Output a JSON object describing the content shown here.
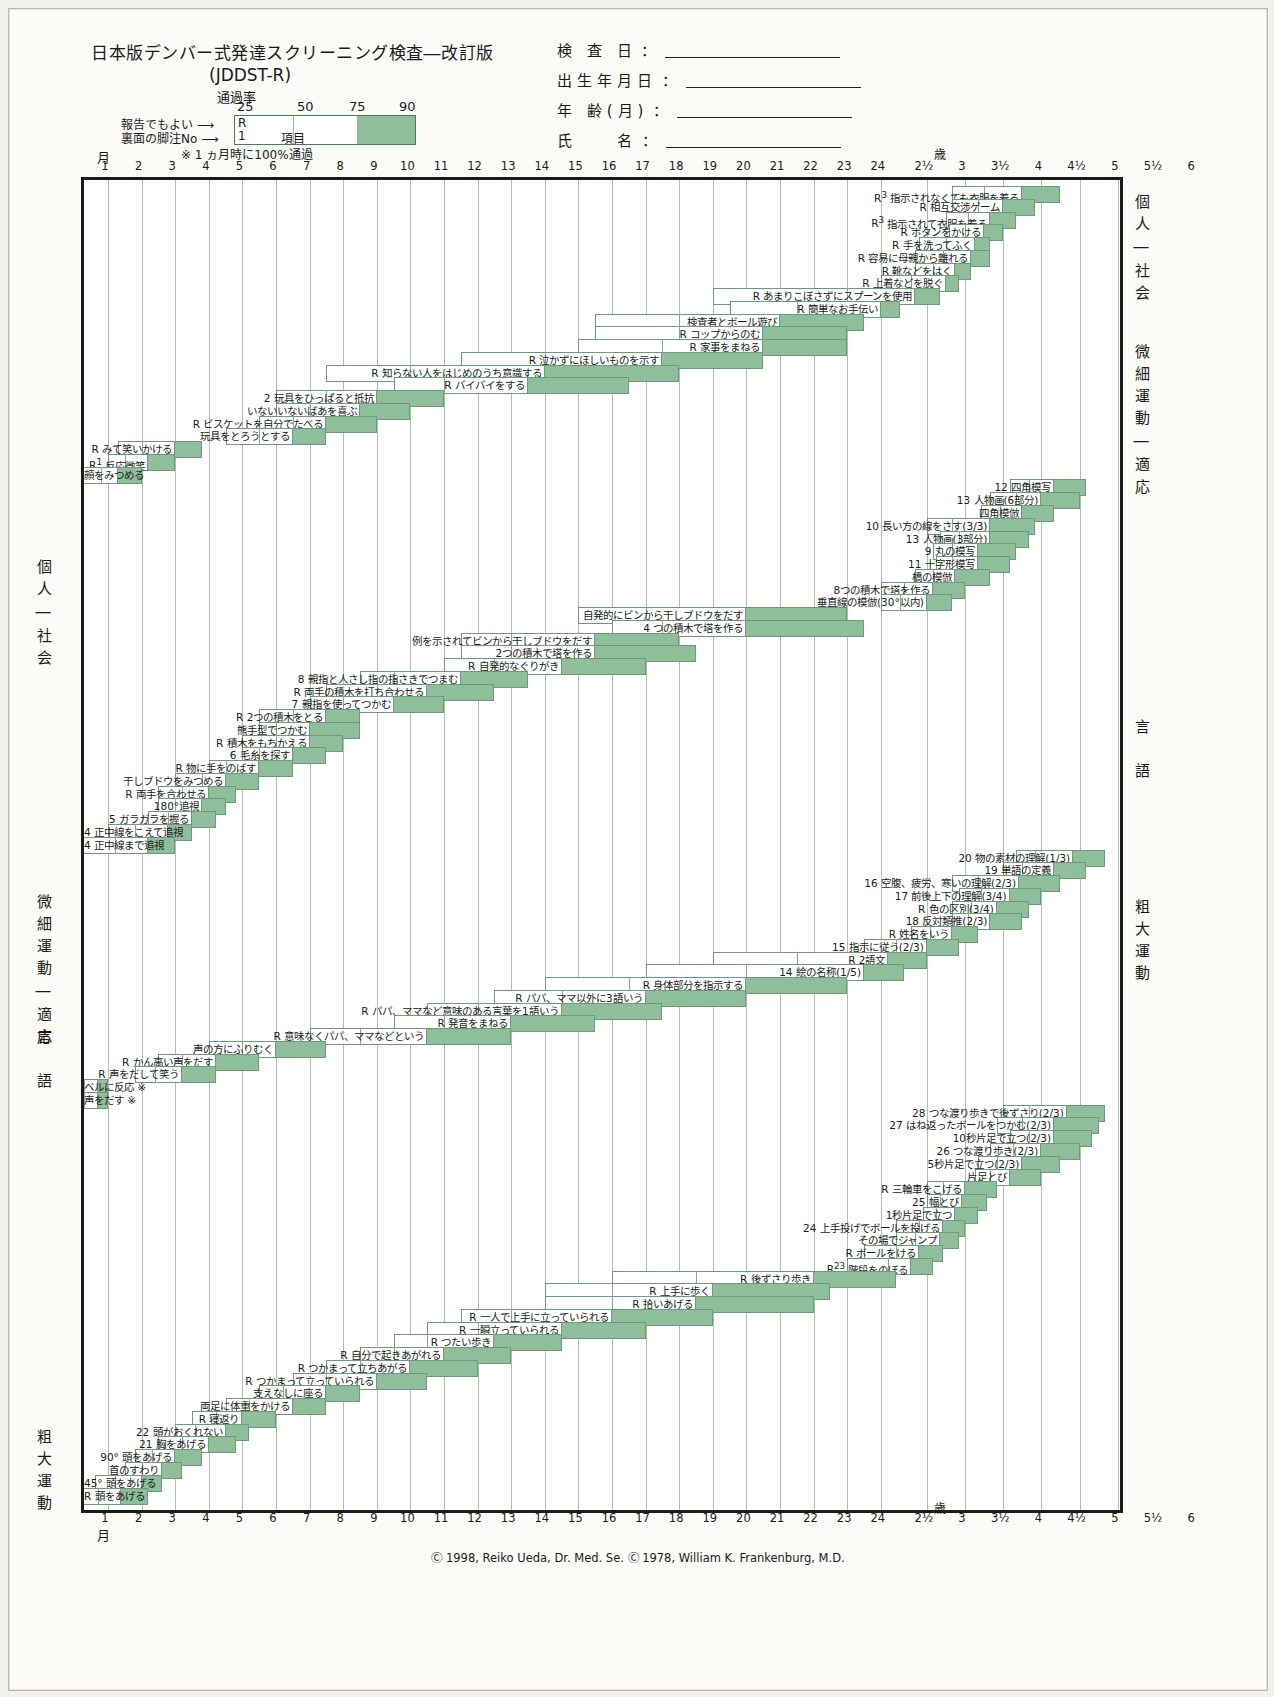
{
  "header": {
    "title": "日本版デンバー式発達スクリーニング検査―改訂版",
    "subtitle": "(JDDST-R)",
    "rate_label": "通過率",
    "pct_ticks": [
      "25",
      "50",
      "75",
      "90"
    ],
    "legend_r": "R",
    "legend_no": "1",
    "legend_item": "項目",
    "arrow_report": "報告でもよい ⟶",
    "arrow_footnote": "裏面の脚注No ⟶",
    "note": "※ 1 ヵ月時に100%通過",
    "month_label": "月",
    "fields": [
      {
        "label": "検 査 日",
        "value": ""
      },
      {
        "label": "出生年月日",
        "value": ""
      },
      {
        "label": "年 齢(月)",
        "value": ""
      },
      {
        "label": "氏　　名",
        "value": ""
      }
    ]
  },
  "axis": {
    "unit_month": "月",
    "unit_year": "歳",
    "ticks": [
      "1",
      "2",
      "3",
      "4",
      "5",
      "6",
      "7",
      "8",
      "9",
      "10",
      "11",
      "12",
      "13",
      "14",
      "15",
      "16",
      "17",
      "18",
      "19",
      "20",
      "21",
      "22",
      "23",
      "24",
      "2½",
      "3",
      "3½",
      "4",
      "4½",
      "5",
      "5½",
      "6"
    ]
  },
  "side_labels": {
    "right_top": "個人―社会",
    "right_fine": "微細運動―適応",
    "right_lang": "言　語",
    "right_gross": "粗大運動",
    "left_personal": "個人―社会",
    "left_fine": "微細運動―適応",
    "left_lang": "言　語",
    "left_gross": "粗大運動"
  },
  "footer": {
    "copyright": "Ⓒ 1998, Reiko Ueda, Dr. Med. Se. Ⓒ 1978, William K. Frankenburg, M.D."
  },
  "colors": {
    "green": "#8fbf9a",
    "green_border": "#6f9a79",
    "grid": "#a8c3ad",
    "frame": "#1c1c1a"
  },
  "chart_data": {
    "type": "bar",
    "title": "日本版デンバー式発達スクリーニング検査―改訂版 (JDDST-R)",
    "xlabel": "月 / 歳",
    "ylabel": "",
    "legend": [
      "25% 通過",
      "50% 通過",
      "75% 通過",
      "90% 通過"
    ],
    "note": "各バーは左端=25%通過月齢、内側の縦線=50%、白/緑境界=75%、右端=90%通過月齢",
    "items": [
      {
        "row": 0,
        "prefix": "R<sup>3</sup>",
        "label": "指示されなくても衣服を着る",
        "p25": 34.0,
        "p75": 45.0,
        "p90": 51.0,
        "p50": 39.0
      },
      {
        "row": 1,
        "prefix": "R",
        "label": "相互交渉ゲーム",
        "p25": 34.0,
        "p75": 42.0,
        "p90": 47.0,
        "p50": 38.0
      },
      {
        "row": 2,
        "prefix": "R<sup>3</sup>",
        "label": "指示されて衣服を着る",
        "p25": 33.0,
        "p75": 40.0,
        "p90": 44.0,
        "p50": 36.5
      },
      {
        "row": 3,
        "prefix": "R",
        "label": "ボタンをかける",
        "p25": 33.5,
        "p75": 39.0,
        "p90": 42.0,
        "p50": 36.0
      },
      {
        "row": 4,
        "prefix": "R",
        "label": "手を洗ってふく",
        "p25": 29.0,
        "p75": 37.5,
        "p90": 40.0,
        "p50": 33.0
      },
      {
        "row": 5,
        "prefix": "R",
        "label": "容易に母親から離れる",
        "p25": 28.5,
        "p75": 37.0,
        "p90": 40.0,
        "p50": 32.5
      },
      {
        "row": 6,
        "prefix": "R",
        "label": "靴などをはく",
        "p25": 28.5,
        "p75": 34.5,
        "p90": 37.0,
        "p50": 31.0
      },
      {
        "row": 7,
        "prefix": "R",
        "label": "上着などを脱ぐ",
        "p25": 24.0,
        "p75": 33.0,
        "p90": 35.0,
        "p50": 28.0
      },
      {
        "row": 8,
        "prefix": "R",
        "label": "あまりこぼさずにスプーンを使用",
        "p25": 19.0,
        "p75": 28.5,
        "p90": 32.0,
        "p50": 23.0
      },
      {
        "row": 9,
        "prefix": "R",
        "label": "簡単なお手伝い",
        "p25": 19.5,
        "p75": 24.0,
        "p90": 26.5,
        "p50": 21.5
      },
      {
        "row": 10,
        "prefix": "",
        "label": "検査者とボール遊び",
        "p25": 15.5,
        "p75": 21.0,
        "p90": 23.5,
        "p50": 18.0
      },
      {
        "row": 11,
        "prefix": "R",
        "label": "コップからのむ",
        "p25": 15.5,
        "p75": 20.5,
        "p90": 23.0,
        "p50": 18.0
      },
      {
        "row": 12,
        "prefix": "R",
        "label": "家事をまねる",
        "p25": 15.0,
        "p75": 20.5,
        "p90": 23.0,
        "p50": 17.5
      },
      {
        "row": 13,
        "prefix": "R",
        "label": "泣かずにほしいものを示す",
        "p25": 11.5,
        "p75": 17.5,
        "p90": 20.5,
        "p50": 14.0
      },
      {
        "row": 14,
        "prefix": "R",
        "label": "知らない人をはじめのうち意識する",
        "p25": 7.5,
        "p75": 14.0,
        "p90": 18.0,
        "p50": 10.0
      },
      {
        "row": 15,
        "prefix": "R",
        "label": "バイバイをする",
        "p25": 9.5,
        "p75": 13.5,
        "p90": 16.5,
        "p50": 11.0
      },
      {
        "row": 16,
        "prefix": "2",
        "label": "玩具をひっぱると抵抗",
        "p25": 6.0,
        "p75": 9.0,
        "p90": 11.0,
        "p50": 7.5
      },
      {
        "row": 17,
        "prefix": "",
        "label": "いないいないばあを喜ぶ",
        "p25": 6.0,
        "p75": 8.5,
        "p90": 10.0,
        "p50": 7.0
      },
      {
        "row": 18,
        "prefix": "R",
        "label": "ビスケットを自分でたべる",
        "p25": 5.5,
        "p75": 7.5,
        "p90": 9.0,
        "p50": 6.5
      },
      {
        "row": 19,
        "prefix": "",
        "label": "玩具をとろうとする",
        "p25": 4.5,
        "p75": 6.5,
        "p90": 7.5,
        "p50": 5.5
      },
      {
        "row": 20,
        "prefix": "R",
        "label": "みて笑いかける",
        "p25": 1.3,
        "p75": 3.0,
        "p90": 3.8,
        "p50": 2.0
      },
      {
        "row": 21,
        "prefix": "R<sup>1</sup>",
        "label": "反応微笑",
        "p25": 1.0,
        "p75": 2.2,
        "p90": 3.0,
        "p50": 1.5
      },
      {
        "row": 22,
        "prefix": "",
        "label": "顔をみつめる",
        "p25": 0.0,
        "p75": 1.3,
        "p90": 2.0,
        "p50": 0.8
      },
      {
        "row": 23,
        "prefix": "12",
        "label": "四角模写",
        "p25": 43.0,
        "p75": 50.0,
        "p90": 55.0,
        "p50": 46.0
      },
      {
        "row": 24,
        "prefix": "13",
        "label": "人物画(6部分)",
        "p25": 40.0,
        "p75": 48.0,
        "p90": 54.0,
        "p50": 44.0
      },
      {
        "row": 25,
        "prefix": "",
        "label": "四角模倣",
        "p25": 38.5,
        "p75": 45.0,
        "p90": 50.0,
        "p50": 41.5
      },
      {
        "row": 26,
        "prefix": "10",
        "label": "長い方の線をさす(3/3)",
        "p25": 30.0,
        "p75": 40.0,
        "p90": 47.0,
        "p50": 34.0
      },
      {
        "row": 27,
        "prefix": "13",
        "label": "人物画(3部分)",
        "p25": 32.0,
        "p75": 40.0,
        "p90": 46.0,
        "p50": 35.0
      },
      {
        "row": 28,
        "prefix": "9",
        "label": "丸の模写",
        "p25": 31.0,
        "p75": 38.0,
        "p90": 44.0,
        "p50": 34.0
      },
      {
        "row": 29,
        "prefix": "11",
        "label": "十字形模写",
        "p25": 31.5,
        "p75": 38.0,
        "p90": 43.0,
        "p50": 34.0
      },
      {
        "row": 30,
        "prefix": "",
        "label": "橋の模倣",
        "p25": 28.5,
        "p75": 34.5,
        "p90": 40.0,
        "p50": 31.0
      },
      {
        "row": 31,
        "prefix": "",
        "label": "8つの積木で塔を作る",
        "p25": 24.0,
        "p75": 31.0,
        "p90": 36.0,
        "p50": 27.0
      },
      {
        "row": 32,
        "prefix": "",
        "label": "垂直線の模倣(30°以内)",
        "p25": 24.0,
        "p75": 30.0,
        "p90": 34.0,
        "p50": 26.5
      },
      {
        "row": 33,
        "prefix": "",
        "label": "自発的にビンから干しブドウをだす",
        "p25": 15.0,
        "p75": 20.0,
        "p90": 23.0,
        "p50": 17.0
      },
      {
        "row": 34,
        "prefix": "4",
        "label": "つの積木で塔を作る",
        "p25": 16.0,
        "p75": 20.0,
        "p90": 23.5,
        "p50": 17.5
      },
      {
        "row": 35,
        "prefix": "",
        "label": "例を示されてビンから干しブドウをだす",
        "p25": 11.5,
        "p75": 15.5,
        "p90": 18.0,
        "p50": 13.0
      },
      {
        "row": 36,
        "prefix": "",
        "label": "2つの積木で塔を作る",
        "p25": 11.5,
        "p75": 15.5,
        "p90": 18.5,
        "p50": 13.0
      },
      {
        "row": 37,
        "prefix": "R",
        "label": "自発的なぐりがき",
        "p25": 11.0,
        "p75": 14.5,
        "p90": 17.0,
        "p50": 12.5
      },
      {
        "row": 38,
        "prefix": "8",
        "label": "親指と人さし指の指さきでつまむ",
        "p25": 8.5,
        "p75": 11.5,
        "p90": 13.5,
        "p50": 9.5
      },
      {
        "row": 39,
        "prefix": "R",
        "label": "両手の積木を打ち合わせる",
        "p25": 7.5,
        "p75": 10.5,
        "p90": 12.5,
        "p50": 9.0
      },
      {
        "row": 40,
        "prefix": "7",
        "label": "親指を使ってつかむ",
        "p25": 7.0,
        "p75": 9.5,
        "p90": 11.0,
        "p50": 8.0
      },
      {
        "row": 41,
        "prefix": "R",
        "label": "2つの積木をとる",
        "p25": 5.5,
        "p75": 7.5,
        "p90": 8.5,
        "p50": 6.5
      },
      {
        "row": 42,
        "prefix": "",
        "label": "熊手型でつかむ",
        "p25": 5.5,
        "p75": 7.0,
        "p90": 8.5,
        "p50": 6.0
      },
      {
        "row": 43,
        "prefix": "R",
        "label": "積木をもちかえる",
        "p25": 5.0,
        "p75": 7.0,
        "p90": 8.0,
        "p50": 6.0
      },
      {
        "row": 44,
        "prefix": "6",
        "label": "毛糸を探す",
        "p25": 5.0,
        "p75": 6.5,
        "p90": 7.5,
        "p50": 5.5
      },
      {
        "row": 45,
        "prefix": "R",
        "label": "物に手をのばす",
        "p25": 4.0,
        "p75": 5.5,
        "p90": 6.5,
        "p50": 4.5
      },
      {
        "row": 46,
        "prefix": "",
        "label": "干しブドウをみつめる",
        "p25": 3.0,
        "p75": 4.5,
        "p90": 5.5,
        "p50": 3.8
      },
      {
        "row": 47,
        "prefix": "R",
        "label": "両手を合わせる",
        "p25": 2.5,
        "p75": 4.0,
        "p90": 4.8,
        "p50": 3.2
      },
      {
        "row": 48,
        "prefix": "",
        "label": "180°追視",
        "p25": 2.5,
        "p75": 3.8,
        "p90": 4.5,
        "p50": 3.0
      },
      {
        "row": 49,
        "prefix": "5",
        "label": "ガラガラを握る",
        "p25": 2.2,
        "p75": 3.5,
        "p90": 4.2,
        "p50": 2.8
      },
      {
        "row": 50,
        "prefix": "4",
        "label": "正中線をこえて追視",
        "p25": 1.0,
        "p75": 2.8,
        "p90": 3.5,
        "p50": 1.8
      },
      {
        "row": 51,
        "prefix": "4",
        "label": "正中線まで追視",
        "p25": 0.0,
        "p75": 2.2,
        "p90": 3.0,
        "p50": 1.2
      },
      {
        "row": 52,
        "prefix": "20",
        "label": "物の素材の理解(1/3)",
        "p25": 44.0,
        "p75": 53.0,
        "p90": 58.0,
        "p50": 47.0
      },
      {
        "row": 53,
        "prefix": "19",
        "label": "単語の定義",
        "p25": 42.0,
        "p75": 50.0,
        "p90": 55.0,
        "p50": 45.0
      },
      {
        "row": 54,
        "prefix": "16",
        "label": "空腹、疲労、寒いの理解(2/3)",
        "p25": 34.0,
        "p75": 44.5,
        "p90": 51.0,
        "p50": 38.0
      },
      {
        "row": 55,
        "prefix": "17",
        "label": "前後上下の理解(3/4)",
        "p25": 35.0,
        "p75": 43.0,
        "p90": 48.0,
        "p50": 38.5
      },
      {
        "row": 56,
        "prefix": "R",
        "label": "色の区別(3/4)",
        "p25": 34.0,
        "p75": 41.0,
        "p90": 46.0,
        "p50": 37.0
      },
      {
        "row": 57,
        "prefix": "18",
        "label": "反対類推(2/3)",
        "p25": 34.0,
        "p75": 40.0,
        "p90": 45.0,
        "p50": 36.5
      },
      {
        "row": 58,
        "prefix": "R",
        "label": "姓名をいう",
        "p25": 28.0,
        "p75": 34.0,
        "p90": 38.0,
        "p50": 30.5
      },
      {
        "row": 59,
        "prefix": "15",
        "label": "指示に従う(2/3)",
        "p25": 23.5,
        "p75": 30.0,
        "p90": 35.0,
        "p50": 26.0
      },
      {
        "row": 60,
        "prefix": "R",
        "label": "2語文",
        "p25": 19.0,
        "p75": 25.0,
        "p90": 30.0,
        "p50": 21.5
      },
      {
        "row": 61,
        "prefix": "14",
        "label": "絵の名称(1/5)",
        "p25": 17.0,
        "p75": 23.5,
        "p90": 27.0,
        "p50": 20.0
      },
      {
        "row": 62,
        "prefix": "R",
        "label": "身体部分を指示する",
        "p25": 14.0,
        "p75": 20.0,
        "p90": 23.0,
        "p50": 16.5
      },
      {
        "row": 63,
        "prefix": "R",
        "label": "パパ、ママ以外に3語いう",
        "p25": 12.5,
        "p75": 17.0,
        "p90": 20.0,
        "p50": 14.5
      },
      {
        "row": 64,
        "prefix": "R",
        "label": "パパ、ママなど意味のある言葉を1語いう",
        "p25": 10.5,
        "p75": 14.5,
        "p90": 17.5,
        "p50": 12.0
      },
      {
        "row": 65,
        "prefix": "R",
        "label": "発音をまねる",
        "p25": 9.5,
        "p75": 13.0,
        "p90": 15.5,
        "p50": 11.0
      },
      {
        "row": 66,
        "prefix": "R",
        "label": "意味なくパパ、ママなどという",
        "p25": 7.0,
        "p75": 10.5,
        "p90": 13.0,
        "p50": 8.5
      },
      {
        "row": 67,
        "prefix": "",
        "label": "声の方にふりむく",
        "p25": 4.0,
        "p75": 6.0,
        "p90": 7.5,
        "p50": 5.0
      },
      {
        "row": 68,
        "prefix": "R",
        "label": "かん高い声をだす",
        "p25": 2.5,
        "p75": 4.2,
        "p90": 5.5,
        "p50": 3.2
      },
      {
        "row": 69,
        "prefix": "R",
        "label": "声をだして笑う",
        "p25": 1.8,
        "p75": 3.2,
        "p90": 4.2,
        "p50": 2.4
      },
      {
        "row": 70,
        "prefix": "",
        "label": "ベルに反応 ※",
        "p25": 0.0,
        "p75": 0.7,
        "p90": 1.0,
        "p50": 0.3
      },
      {
        "row": 71,
        "prefix": "",
        "label": "声をだす ※",
        "p25": 0.0,
        "p75": 0.7,
        "p90": 1.0,
        "p50": 0.3
      },
      {
        "row": 72,
        "prefix": "28",
        "label": "つな渡り歩きで後ずさり(2/3)",
        "p25": 42.0,
        "p75": 52.0,
        "p90": 58.0,
        "p50": 46.0
      },
      {
        "row": 73,
        "prefix": "27",
        "label": "はね返ったボールをつかむ(2/3)",
        "p25": 41.0,
        "p75": 50.0,
        "p90": 57.0,
        "p50": 45.0
      },
      {
        "row": 74,
        "prefix": "",
        "label": "10秒片足で立つ(2/3)",
        "p25": 43.0,
        "p75": 50.0,
        "p90": 56.0,
        "p50": 46.0
      },
      {
        "row": 75,
        "prefix": "26",
        "label": "つな渡り歩き(2/3)",
        "p25": 40.0,
        "p75": 48.0,
        "p90": 54.0,
        "p50": 43.5
      },
      {
        "row": 76,
        "prefix": "",
        "label": "5秒片足で立つ(2/3)",
        "p25": 38.0,
        "p75": 45.0,
        "p90": 51.0,
        "p50": 41.0
      },
      {
        "row": 77,
        "prefix": "",
        "label": "片足とび",
        "p25": 37.5,
        "p75": 43.0,
        "p90": 48.0,
        "p50": 40.0
      },
      {
        "row": 78,
        "prefix": "R",
        "label": "三輪車をこげる",
        "p25": 30.0,
        "p75": 36.0,
        "p90": 41.0,
        "p50": 32.5
      },
      {
        "row": 79,
        "prefix": "25",
        "label": "幅とび",
        "p25": 30.0,
        "p75": 35.5,
        "p90": 39.5,
        "p50": 32.0
      },
      {
        "row": 80,
        "prefix": "",
        "label": "1秒片足で立つ",
        "p25": 29.5,
        "p75": 34.5,
        "p90": 38.0,
        "p50": 31.5
      },
      {
        "row": 81,
        "prefix": "24",
        "label": "上手投げでボールを投げる",
        "p25": 26.0,
        "p75": 32.5,
        "p90": 36.0,
        "p50": 29.0
      },
      {
        "row": 82,
        "prefix": "",
        "label": "その場でジャンプ",
        "p25": 26.0,
        "p75": 32.0,
        "p90": 35.0,
        "p50": 28.5
      },
      {
        "row": 83,
        "prefix": "R",
        "label": "ボールをける",
        "p25": 23.5,
        "p75": 29.0,
        "p90": 32.5,
        "p50": 26.0
      },
      {
        "row": 84,
        "prefix": "R<sup>23</sup>",
        "label": "階段をのぼる",
        "p25": 23.0,
        "p75": 28.0,
        "p90": 31.0,
        "p50": 25.0
      },
      {
        "row": 85,
        "prefix": "R",
        "label": "後ずさり歩き",
        "p25": 16.0,
        "p75": 22.0,
        "p90": 26.0,
        "p50": 18.5
      },
      {
        "row": 86,
        "prefix": "R",
        "label": "上手に歩く",
        "p25": 14.0,
        "p75": 19.0,
        "p90": 22.5,
        "p50": 16.0
      },
      {
        "row": 87,
        "prefix": "R",
        "label": "拾いあげる",
        "p25": 14.0,
        "p75": 18.5,
        "p90": 22.0,
        "p50": 16.0
      },
      {
        "row": 88,
        "prefix": "R",
        "label": "一人で上手に立っていられる",
        "p25": 11.5,
        "p75": 16.0,
        "p90": 19.0,
        "p50": 13.0
      },
      {
        "row": 89,
        "prefix": "R",
        "label": "一瞬立っていられる",
        "p25": 10.5,
        "p75": 14.5,
        "p90": 17.0,
        "p50": 12.0
      },
      {
        "row": 90,
        "prefix": "R",
        "label": "つたい歩き",
        "p25": 9.5,
        "p75": 12.5,
        "p90": 14.5,
        "p50": 10.5
      },
      {
        "row": 91,
        "prefix": "R",
        "label": "自分で起きあがれる",
        "p25": 8.5,
        "p75": 11.0,
        "p90": 13.0,
        "p50": 9.5
      },
      {
        "row": 92,
        "prefix": "R",
        "label": "つかまって立ちあがる",
        "p25": 7.5,
        "p75": 10.0,
        "p90": 12.0,
        "p50": 8.5
      },
      {
        "row": 93,
        "prefix": "R",
        "label": "つかまって立っていられる",
        "p25": 6.5,
        "p75": 9.0,
        "p90": 10.5,
        "p50": 7.5
      },
      {
        "row": 94,
        "prefix": "",
        "label": "支えなしに座る",
        "p25": 5.5,
        "p75": 7.5,
        "p90": 8.5,
        "p50": 6.2
      },
      {
        "row": 95,
        "prefix": "",
        "label": "両足に体重をかける",
        "p25": 4.5,
        "p75": 6.5,
        "p90": 7.5,
        "p50": 5.2
      },
      {
        "row": 96,
        "prefix": "R",
        "label": "寝返り",
        "p25": 3.5,
        "p75": 5.0,
        "p90": 6.0,
        "p50": 4.2
      },
      {
        "row": 97,
        "prefix": "22",
        "label": "頭がおくれない",
        "p25": 3.0,
        "p75": 4.5,
        "p90": 5.2,
        "p50": 3.6
      },
      {
        "row": 98,
        "prefix": "21",
        "label": "胸をあげる",
        "p25": 2.5,
        "p75": 4.0,
        "p90": 4.8,
        "p50": 3.2
      },
      {
        "row": 99,
        "prefix": "90°",
        "label": "頭をあげる",
        "p25": 1.8,
        "p75": 3.0,
        "p90": 3.8,
        "p50": 2.3
      },
      {
        "row": 100,
        "prefix": "",
        "label": "首のすわり",
        "p25": 1.5,
        "p75": 2.6,
        "p90": 3.2,
        "p50": 2.0
      },
      {
        "row": 101,
        "prefix": "45°",
        "label": "頭をあげる",
        "p25": 0.6,
        "p75": 2.0,
        "p90": 2.6,
        "p50": 1.2
      },
      {
        "row": 102,
        "prefix": "R",
        "label": "頭をあげる",
        "p25": 0.0,
        "p75": 1.4,
        "p90": 2.2,
        "p50": 0.7
      }
    ]
  }
}
